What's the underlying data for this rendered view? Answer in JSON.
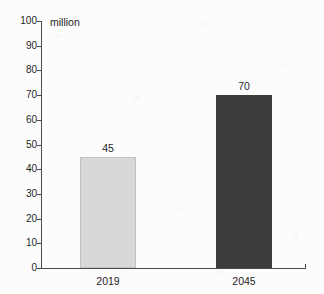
{
  "chart_data": {
    "type": "bar",
    "title": "",
    "subtitle": "",
    "xlabel": "",
    "ylabel": "million",
    "unit_label": "million",
    "categories": [
      "2019",
      "2045"
    ],
    "values": [
      45,
      70
    ],
    "value_labels": [
      "45",
      "70"
    ],
    "ylim": [
      0,
      100
    ],
    "y_ticks": [
      0,
      10,
      20,
      30,
      40,
      50,
      60,
      70,
      80,
      90,
      100
    ],
    "y_tick_labels": [
      "0",
      "10",
      "20",
      "30",
      "40",
      "50",
      "60",
      "70",
      "80",
      "90",
      "100"
    ],
    "grid": false,
    "legend": null,
    "legend_position": "none",
    "bar_colors": [
      "#d8d8d8",
      "#3c3c3c"
    ],
    "series": [
      {
        "name": "population",
        "points": [
          {
            "category": "2019",
            "value": 45,
            "label": "45",
            "color": "#d8d8d8"
          },
          {
            "category": "2045",
            "value": 70,
            "label": "70",
            "color": "#3c3c3c"
          }
        ]
      }
    ],
    "annotations": []
  },
  "colors": {
    "background": "#fcfcfc",
    "axis": "#4a4a4a",
    "text": "#1f1f1f",
    "bar_light": "#d8d8d8",
    "bar_dark": "#3c3c3c"
  }
}
